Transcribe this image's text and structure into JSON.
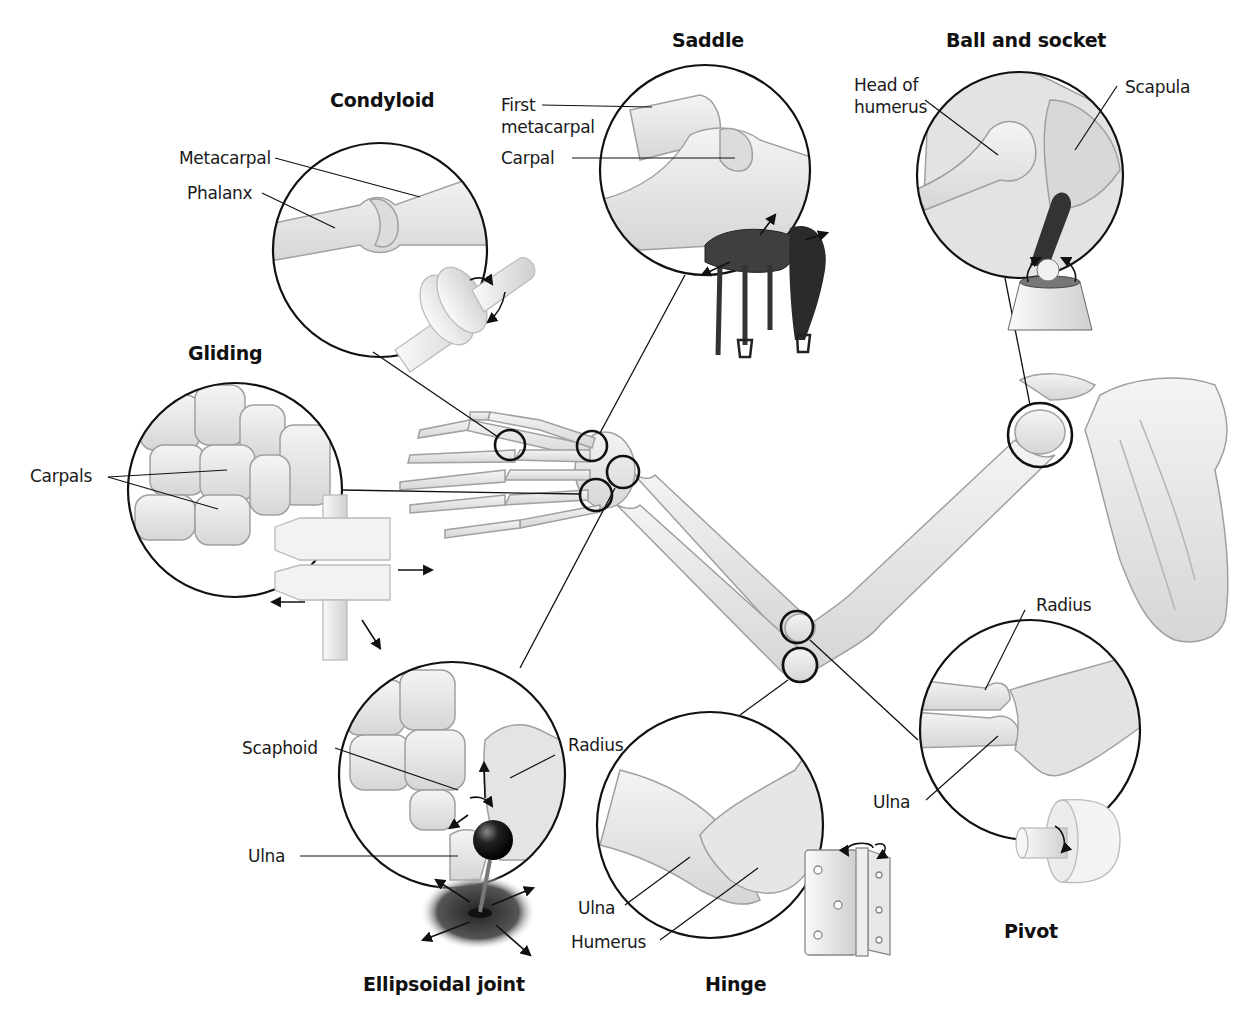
{
  "diagram": {
    "colors": {
      "bone_fill": "#e9e9e9",
      "bone_stroke": "#9a9a9a",
      "outline": "#111111",
      "saddle_dark": "#3a3a3a",
      "background": "#ffffff"
    }
  },
  "joints": {
    "condyloid": {
      "title": "Condyloid",
      "labels": {
        "metacarpal": "Metacarpal",
        "phalanx": "Phalanx"
      },
      "model_icon": "disc-on-axle-icon"
    },
    "saddle": {
      "title": "Saddle",
      "labels": {
        "first_metacarpal": "First\nmetacarpal",
        "carpal": "Carpal"
      },
      "model_icon": "horse-saddle-icon"
    },
    "ball_and_socket": {
      "title": "Ball and socket",
      "labels": {
        "head_of_humerus": "Head of\nhumerus",
        "scapula": "Scapula"
      },
      "model_icon": "ball-in-cup-icon"
    },
    "gliding": {
      "title": "Gliding",
      "labels": {
        "carpals": "Carpals"
      },
      "model_icon": "sliding-plates-icon"
    },
    "ellipsoidal": {
      "title": "Ellipsoidal joint",
      "labels": {
        "scaphoid": "Scaphoid",
        "radius": "Radius",
        "ulna": "Ulna"
      },
      "model_icon": "joystick-icon"
    },
    "hinge": {
      "title": "Hinge",
      "labels": {
        "ulna": "Ulna",
        "humerus": "Humerus"
      },
      "model_icon": "door-hinge-icon"
    },
    "pivot": {
      "title": "Pivot",
      "labels": {
        "radius": "Radius",
        "ulna": "Ulna"
      },
      "model_icon": "axle-in-wheel-icon"
    }
  }
}
